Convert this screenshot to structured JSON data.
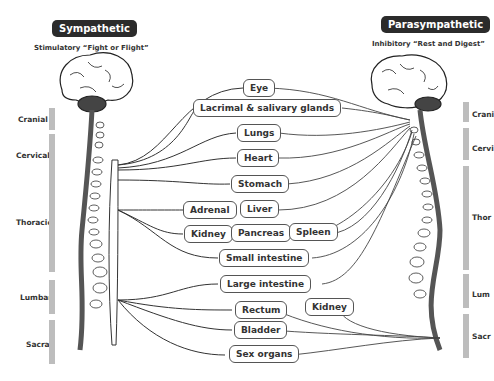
{
  "sympathetic": {
    "title": "Sympathetic",
    "subtitle": "Stimulatory “Fight or Flight”",
    "regions": [
      "Cranial",
      "Cervical",
      "Thoracic",
      "Lumbar",
      "Sacral"
    ]
  },
  "parasympathetic": {
    "title": "Parasympathetic",
    "subtitle": "Inhibitory “Rest and Digest”",
    "regions": [
      "Crani",
      "Cervi",
      "Thor",
      "Lum",
      "Sacr"
    ]
  },
  "organs": {
    "eye": "Eye",
    "lacrimal": "Lacrimal & salivary glands",
    "lungs": "Lungs",
    "heart": "Heart",
    "stomach": "Stomach",
    "adrenal": "Adrenal",
    "liver": "Liver",
    "kidney": "Kidney",
    "pancreas": "Pancreas",
    "spleen": "Spleen",
    "small_intestine": "Small intestine",
    "large_intestine": "Large intestine",
    "rectum": "Rectum",
    "kidney2": "Kidney",
    "bladder": "Bladder",
    "sex_organs": "Sex organs"
  },
  "colors": {
    "pill": "#2b2b2b",
    "bar": "#bdbdbd",
    "line": "#444444"
  }
}
